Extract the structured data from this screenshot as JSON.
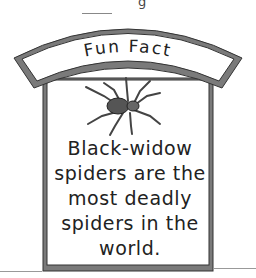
{
  "top_clipped_text": "g",
  "banner": {
    "title": "Fun Fact"
  },
  "illustration": {
    "subject": "black-widow-spider"
  },
  "fact": {
    "lines": [
      "Black-widow",
      "spiders are the",
      "most deadly",
      "spiders in the",
      "world."
    ]
  },
  "colors": {
    "frame": "#7a7a7a",
    "frame_outline": "#333333",
    "background": "#ffffff",
    "text": "#222222"
  }
}
